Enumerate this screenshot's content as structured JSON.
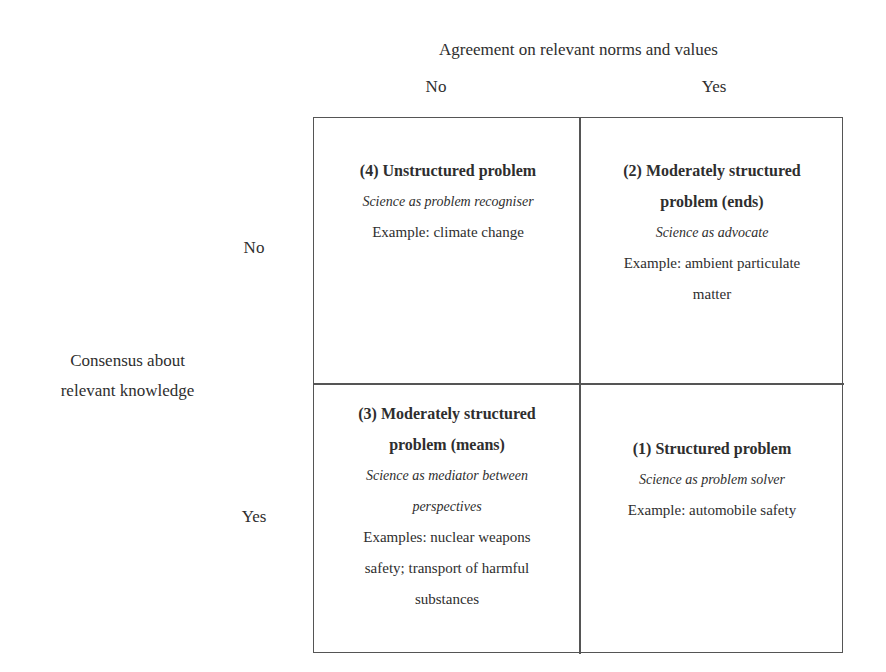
{
  "diagram": {
    "x_axis": {
      "title": "Agreement on relevant norms and values",
      "labels": [
        "No",
        "Yes"
      ]
    },
    "y_axis": {
      "title_line1": "Consensus about",
      "title_line2": "relevant knowledge",
      "labels": [
        "No",
        "Yes"
      ]
    },
    "cells": {
      "top_left": {
        "title": "(4) Unstructured problem",
        "role": "Science as problem recogniser",
        "example": "Example: climate change"
      },
      "top_right": {
        "title_line1": "(2) Moderately structured",
        "title_line2": "problem (ends)",
        "role": "Science as advocate",
        "example_line1": "Example: ambient particulate",
        "example_line2": "matter"
      },
      "bottom_left": {
        "title_line1": "(3) Moderately structured",
        "title_line2": "problem (means)",
        "role_line1": "Science as mediator between",
        "role_line2": "perspectives",
        "example_line1": "Examples: nuclear weapons",
        "example_line2": "safety; transport of harmful",
        "example_line3": "substances"
      },
      "bottom_right": {
        "title": "(1) Structured problem",
        "role": "Science as problem solver",
        "example": "Example: automobile safety"
      }
    },
    "colors": {
      "text": "#2e2e2e",
      "border": "#555555",
      "background": "#ffffff"
    }
  }
}
